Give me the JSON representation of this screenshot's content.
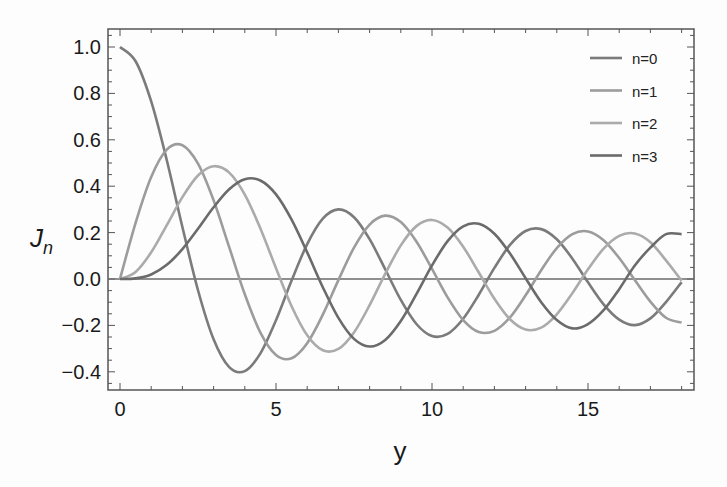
{
  "chart_data": {
    "type": "line",
    "title": "",
    "xlabel": "y",
    "ylabel": "J",
    "ylabel_subscript": "n",
    "xlim": [
      -0.4,
      18.4
    ],
    "ylim": [
      -0.48,
      1.07
    ],
    "xticks": [
      0,
      5,
      10,
      15
    ],
    "xtick_labels": [
      "0",
      "5",
      "10",
      "15"
    ],
    "yticks": [
      -0.4,
      -0.2,
      0.0,
      0.2,
      0.4,
      0.6,
      0.8,
      1.0
    ],
    "ytick_labels": [
      "-0.4",
      "-0.2",
      "0.0",
      "0.2",
      "0.4",
      "0.6",
      "0.8",
      "1.0"
    ],
    "grid": false,
    "zero_line": true,
    "legend_position": "upper right",
    "x": [
      0,
      0.5,
      1,
      1.5,
      2,
      2.5,
      3,
      3.5,
      4,
      4.5,
      5,
      5.5,
      6,
      6.5,
      7,
      7.5,
      8,
      8.5,
      9,
      9.5,
      10,
      10.5,
      11,
      11.5,
      12,
      12.5,
      13,
      13.5,
      14,
      14.5,
      15,
      15.5,
      16,
      16.5,
      17,
      17.5,
      18
    ],
    "series": [
      {
        "name": "n=0",
        "color": "#7b7b7b",
        "values": [
          1,
          0.9385,
          0.7652,
          0.5118,
          0.2239,
          -0.0484,
          -0.2601,
          -0.3801,
          -0.3971,
          -0.3205,
          -0.1776,
          -0.0068,
          0.1506,
          0.2601,
          0.3001,
          0.2663,
          0.1717,
          0.0419,
          -0.0903,
          -0.1939,
          -0.2459,
          -0.2366,
          -0.1712,
          -0.0677,
          0.0477,
          0.1469,
          0.2069,
          0.215,
          0.1711,
          0.0875,
          -0.0142,
          -0.1092,
          -0.1749,
          -0.1988,
          -0.1699,
          -0.0993,
          -0.0134
        ]
      },
      {
        "name": "n=1",
        "color": "#9c9c9c",
        "values": [
          0,
          0.2423,
          0.4401,
          0.5579,
          0.5767,
          0.4971,
          0.3391,
          0.1374,
          -0.066,
          -0.2311,
          -0.3276,
          -0.3414,
          -0.2767,
          -0.1538,
          -0.0047,
          0.1352,
          0.2346,
          0.2731,
          0.2453,
          0.1613,
          0.0435,
          -0.0789,
          -0.1768,
          -0.2284,
          -0.2234,
          -0.1655,
          -0.0703,
          0.038,
          0.1334,
          0.1934,
          0.2051,
          0.1672,
          0.0904,
          -0.0047,
          -0.0977,
          -0.1672,
          -0.188
        ]
      },
      {
        "name": "n=2",
        "color": "#ababab",
        "values": [
          0,
          0.0306,
          0.1149,
          0.2321,
          0.3528,
          0.4461,
          0.4861,
          0.4586,
          0.3641,
          0.2178,
          0.0466,
          -0.1173,
          -0.2429,
          -0.3074,
          -0.3014,
          -0.2303,
          -0.113,
          0.0223,
          0.1448,
          0.2279,
          0.2546,
          0.2216,
          0.139,
          0.028,
          -0.0849,
          -0.1734,
          -0.2177,
          -0.2094,
          -0.152,
          -0.0609,
          0.0416,
          0.1308,
          0.1862,
          0.196,
          0.1584,
          0.0802,
          -0.0075
        ]
      },
      {
        "name": "n=3",
        "color": "#6b6b6b",
        "values": [
          0,
          0.0026,
          0.0196,
          0.061,
          0.1289,
          0.2166,
          0.3091,
          0.3868,
          0.4302,
          0.4247,
          0.3648,
          0.2561,
          0.1148,
          -0.0353,
          -0.1676,
          -0.2581,
          -0.2911,
          -0.2626,
          -0.1809,
          -0.0653,
          0.0584,
          0.1633,
          0.2273,
          0.2381,
          0.1951,
          0.11,
          0.0033,
          -0.1,
          -0.1768,
          -0.2129,
          -0.194,
          -0.1343,
          -0.0438,
          0.0585,
          0.1349,
          0.1934,
          0.1935
        ]
      }
    ]
  }
}
